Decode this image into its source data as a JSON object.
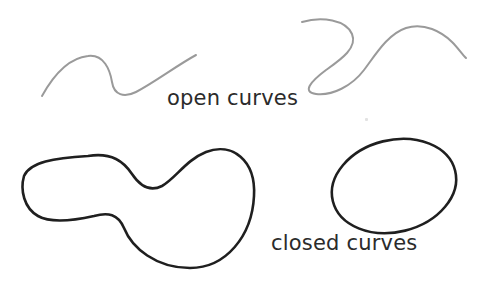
{
  "figure": {
    "background_color": "#ffffff",
    "width": 480,
    "height": 282
  },
  "labels": {
    "open_curves": "open curves",
    "closed_curves": "closed curves",
    "text_color": "#2b2b2b",
    "font_size_px": 21
  },
  "strokes": {
    "open_curve_color": "#9a9a9a",
    "open_curve_width": 2,
    "closed_curve_color": "#1f1f1f",
    "closed_curve_width": 2.6
  },
  "shapes": {
    "open_curve_left": {
      "name": "wavy-open-curve",
      "type": "open",
      "path": "M 42 96 C 52 78, 68 58, 88 56 C 104 54, 110 70, 112 82 C 114 95, 124 98, 136 92 C 155 82, 176 66, 196 55"
    },
    "open_curve_right": {
      "name": "s-shaped-open-curve",
      "type": "open",
      "path": "M 302 22 C 322 16, 346 20, 352 34 C 358 48, 340 60, 326 70 C 310 82, 302 92, 316 94 C 332 96, 352 86, 364 70 C 376 54, 388 34, 406 28 C 424 22, 442 32, 452 42 C 458 48, 462 54, 466 58"
    },
    "closed_curve_blob": {
      "name": "peanut-blob-closed-curve",
      "type": "closed",
      "path": "M 88 156 C 112 152, 124 162, 132 174 C 140 186, 150 192, 162 186 C 176 178, 186 160, 206 152 C 232 142, 256 160, 254 196 C 252 236, 226 268, 190 268 C 156 268, 132 248, 124 228 C 118 214, 108 212, 94 216 C 76 220, 52 224, 38 216 C 24 208, 20 190, 24 176 C 30 162, 54 158, 88 156 Z"
    },
    "closed_curve_ellipse": {
      "name": "oval-closed-curve",
      "type": "closed",
      "cx": 394,
      "cy": 186,
      "rx": 63,
      "ry": 46,
      "rotation_deg": -14
    }
  },
  "artifacts": {
    "speck": "scan-speck"
  }
}
